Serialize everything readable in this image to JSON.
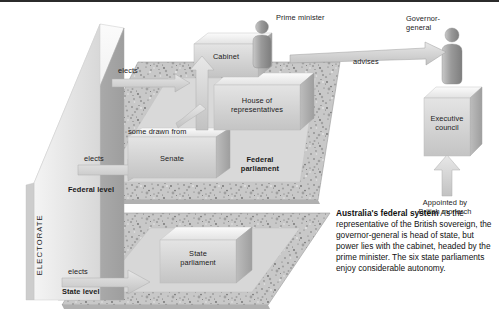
{
  "figure": {
    "title": "Australia's federal system",
    "type": "isometric-flow-diagram",
    "top_rule_color": "#2b2b2b"
  },
  "nodes": {
    "electorate": {
      "label": "ELECTORATE",
      "orientation": "vertical"
    },
    "cabinet": {
      "label": "Cabinet"
    },
    "house": {
      "label": "House of\nrepresentatives"
    },
    "senate": {
      "label": "Senate"
    },
    "state_parliament": {
      "label": "State\nparliament"
    },
    "executive_council": {
      "label": "Executive\ncouncil"
    }
  },
  "people": {
    "prime_minister": {
      "label": "Prime minister",
      "icon": "person-icon"
    },
    "governor_general": {
      "label": "Governor-\ngeneral",
      "icon": "person-icon"
    }
  },
  "group_labels": {
    "federal_parliament": "Federal\nparliament",
    "federal_level": "Federal level",
    "state_level": "State level"
  },
  "edges": {
    "elects_house": "elects",
    "elects_senate": "elects",
    "elects_state": "elects",
    "some_drawn_from": "some drawn from",
    "advises": "advises",
    "appointed_by": "Appointed by\nBritish monarch"
  },
  "caption": {
    "lead": "Australia's federal system",
    "body": " As the representative of the British sovereign, the governor-general is head of state, but power lies with the cabinet, headed by the prime minister. The six state parliaments enjoy considerable autonomy."
  },
  "colors": {
    "box_face": "#d2d2d2",
    "box_top": "#efefef",
    "box_side": "#b8b8b8",
    "arrow": "#cfcfcf",
    "ground": "#c9c9c9",
    "text": "#1b1b1b",
    "rule": "#2b2b2b"
  }
}
